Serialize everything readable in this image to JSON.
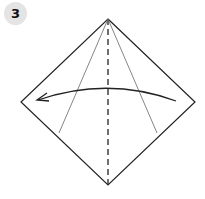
{
  "step": {
    "number": "3",
    "badge_color": "#e4e4e4",
    "text_color": "#111111"
  },
  "diagram": {
    "type": "origami-fold-step",
    "outline_color": "#222222",
    "crease_color": "#555555",
    "elements": [
      {
        "name": "square-diamond-outline",
        "kind": "polygon",
        "points": [
          [
            108,
            19
          ],
          [
            195,
            102
          ],
          [
            108,
            185
          ],
          [
            21,
            102
          ]
        ]
      },
      {
        "name": "center-valley-fold-line",
        "kind": "dashed-line",
        "from": [
          108,
          19
        ],
        "to": [
          108,
          185
        ]
      },
      {
        "name": "left-crease-line",
        "kind": "line",
        "from": [
          108,
          19
        ],
        "to": [
          59,
          133
        ]
      },
      {
        "name": "right-crease-line",
        "kind": "line",
        "from": [
          108,
          19
        ],
        "to": [
          157,
          133
        ]
      },
      {
        "name": "fold-direction-arrow",
        "kind": "arc-arrow",
        "from": [
          176,
          101
        ],
        "to": [
          37,
          100
        ],
        "direction": "right-to-left"
      }
    ]
  }
}
